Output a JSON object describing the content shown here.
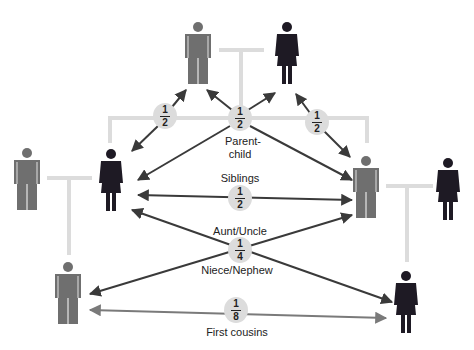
{
  "diagram": {
    "colors": {
      "male": "#6f6f6f",
      "female": "#1e1a24",
      "connector": "#dcdcdc",
      "arrow_dark": "#3a3a3a",
      "arrow_cousins": "#7a7a7a",
      "badge": "#dcdcdc"
    },
    "people": [
      {
        "id": "grandfather",
        "sex": "male",
        "x": 197,
        "top": 22
      },
      {
        "id": "grandmother",
        "sex": "female",
        "x": 287,
        "top": 22
      },
      {
        "id": "uncle-left-spouse",
        "sex": "male",
        "x": 27,
        "top": 146
      },
      {
        "id": "aunt-left",
        "sex": "female",
        "x": 111,
        "top": 148
      },
      {
        "id": "father-right",
        "sex": "male",
        "x": 366,
        "top": 155
      },
      {
        "id": "mother-right-spouse",
        "sex": "female",
        "x": 448,
        "top": 157
      },
      {
        "id": "cousin-left",
        "sex": "male",
        "x": 67,
        "top": 261
      },
      {
        "id": "cousin-right",
        "sex": "female",
        "x": 405,
        "top": 270
      }
    ],
    "relationships": [
      {
        "name": "parent-child-left",
        "numerator": "1",
        "denominator": "2",
        "x": 165,
        "y": 116
      },
      {
        "name": "parent-child-center",
        "numerator": "1",
        "denominator": "2",
        "x": 240,
        "y": 118,
        "label": "Parent-\nchild",
        "label_line1": "Parent-",
        "label_line2": "child"
      },
      {
        "name": "parent-child-right",
        "numerator": "1",
        "denominator": "2",
        "x": 317,
        "y": 122
      },
      {
        "name": "siblings",
        "numerator": "1",
        "denominator": "2",
        "x": 240,
        "y": 198,
        "label": "Siblings"
      },
      {
        "name": "aunt-uncle-niece-nephew",
        "numerator": "1",
        "denominator": "4",
        "x": 240,
        "y": 250,
        "label_top": "Aunt/Uncle",
        "label_bottom": "Niece/Nephew"
      },
      {
        "name": "first-cousins",
        "numerator": "1",
        "denominator": "8",
        "x": 236,
        "y": 310,
        "label": "First cousins"
      }
    ]
  }
}
